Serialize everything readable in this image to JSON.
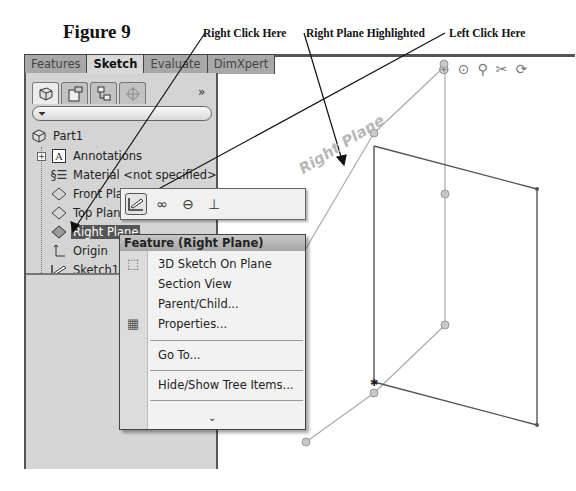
{
  "figure": {
    "title": "Figure 9",
    "callouts": {
      "right_click": "Right Click Here",
      "plane_highlighted": "Right Plane Highlighted",
      "left_click": "Left Click Here"
    }
  },
  "command_manager": {
    "tabs": [
      {
        "label": "Features",
        "active": false
      },
      {
        "label": "Sketch",
        "active": true
      },
      {
        "label": "Evaluate",
        "active": false
      },
      {
        "label": "DimXpert",
        "active": false
      }
    ]
  },
  "feature_manager": {
    "panel_tabs": [
      "featuremanager-tree-icon",
      "propertymanager-icon",
      "configurationmanager-icon",
      "dimxpertmanager-icon"
    ],
    "more_label": "»",
    "filter_icon": "filter-icon",
    "tree": [
      {
        "label": "Part1",
        "icon": "part-icon",
        "level": 0
      },
      {
        "label": "Annotations",
        "icon": "annotations-icon",
        "level": 1,
        "expandable": true
      },
      {
        "label": "Material <not specified>",
        "icon": "material-icon",
        "level": 1
      },
      {
        "label": "Front Plane",
        "icon": "plane-icon",
        "level": 1
      },
      {
        "label": "Top Plane",
        "icon": "plane-icon",
        "level": 1
      },
      {
        "label": "Right Plane",
        "icon": "plane-icon",
        "level": 1,
        "selected": true
      },
      {
        "label": "Origin",
        "icon": "origin-icon",
        "level": 1
      },
      {
        "label": "Sketch1",
        "icon": "sketch-icon",
        "level": 1
      }
    ]
  },
  "context_toolbar": {
    "buttons": [
      {
        "name": "sketch-icon",
        "glyph": "✎",
        "active": true
      },
      {
        "name": "glasses-icon",
        "glyph": "∞",
        "active": false
      },
      {
        "name": "zoom-to-selection-icon",
        "glyph": "⊖",
        "active": false
      },
      {
        "name": "normal-to-icon",
        "glyph": "⊥",
        "active": false
      }
    ]
  },
  "context_menu": {
    "header": "Feature (Right Plane)",
    "items": [
      {
        "label": "3D Sketch On Plane",
        "mnemonic": "3",
        "icon": "3d-sketch-icon"
      },
      {
        "label": "Section View",
        "mnemonic": "e"
      },
      {
        "label": "Parent/Child...",
        "mnemonic": "P"
      },
      {
        "label": "Properties...",
        "mnemonic": "r",
        "icon": "properties-icon"
      },
      {
        "label": "Go To...",
        "mnemonic": "G"
      },
      {
        "label": "Hide/Show Tree Items...",
        "mnemonic": "H"
      }
    ],
    "expand_more": "⌄"
  },
  "graphics_area": {
    "plane_label": "Right Plane",
    "view_toolbar": [
      "zoom-to-fit-icon",
      "zoom-to-area-icon",
      "previous-view-icon",
      "section-view-icon",
      "rotate-view-icon"
    ]
  }
}
